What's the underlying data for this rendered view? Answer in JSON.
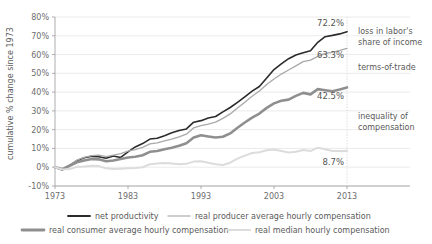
{
  "chart_data": {
    "type": "line",
    "title": "",
    "xlabel": "",
    "ylabel": "cumulative % change since 1973",
    "xlim": [
      1973,
      2014
    ],
    "ylim": [
      -10,
      80
    ],
    "grid": true,
    "legend_position": "bottom",
    "x_ticks": [
      "1973",
      "1983",
      "1993",
      "2003",
      "2013"
    ],
    "x_tick_values": [
      1973,
      1983,
      1993,
      2003,
      2013
    ],
    "y_ticks": [
      "-10%",
      "0%",
      "10%",
      "20%",
      "30%",
      "40%",
      "50%",
      "60%",
      "70%",
      "80%"
    ],
    "y_tick_values": [
      -10,
      0,
      10,
      20,
      30,
      40,
      50,
      60,
      70,
      80
    ],
    "x": [
      1973,
      1974,
      1975,
      1976,
      1977,
      1978,
      1979,
      1980,
      1981,
      1982,
      1983,
      1984,
      1985,
      1986,
      1987,
      1988,
      1989,
      1990,
      1991,
      1992,
      1993,
      1994,
      1995,
      1996,
      1997,
      1998,
      1999,
      2000,
      2001,
      2002,
      2003,
      2004,
      2005,
      2006,
      2007,
      2008,
      2009,
      2010,
      2011,
      2012,
      2013
    ],
    "series": [
      {
        "name": "net productivity",
        "color": "#2b2b2b",
        "width": 1.6,
        "end_label": "72.2%",
        "values": [
          0,
          -1.5,
          1.0,
          3.5,
          5.0,
          5.8,
          5.6,
          4.8,
          6.0,
          5.2,
          8.2,
          10.8,
          12.6,
          15.0,
          15.4,
          16.8,
          18.3,
          19.6,
          20.4,
          24.0,
          24.8,
          26.2,
          27.0,
          29.5,
          31.8,
          34.5,
          37.5,
          40.5,
          43.0,
          47.5,
          52.0,
          55.0,
          57.8,
          59.8,
          61.0,
          62.0,
          66.5,
          69.5,
          70.2,
          71.0,
          72.2
        ]
      },
      {
        "name": "real producer average hourly compensation",
        "color": "#a9a9a9",
        "width": 1.3,
        "end_label": "63.3%",
        "values": [
          0,
          -1.2,
          1.2,
          3.8,
          5.2,
          6.2,
          6.4,
          5.6,
          6.4,
          7.2,
          8.6,
          9.4,
          10.6,
          12.4,
          13.0,
          14.0,
          15.0,
          16.2,
          17.6,
          21.0,
          22.2,
          23.0,
          24.0,
          26.0,
          28.4,
          31.5,
          34.6,
          37.8,
          40.6,
          44.0,
          47.0,
          49.6,
          51.8,
          54.0,
          56.2,
          57.0,
          59.0,
          60.6,
          61.2,
          62.2,
          63.3
        ]
      },
      {
        "name": "real consumer average hourly compensation",
        "color": "#8f8f8f",
        "width": 2.6,
        "end_label": "42.5%",
        "values": [
          0,
          -1.0,
          0.8,
          2.6,
          3.6,
          4.4,
          4.2,
          3.2,
          3.6,
          4.4,
          5.2,
          5.6,
          6.4,
          8.2,
          8.6,
          9.6,
          10.4,
          11.4,
          12.8,
          15.8,
          17.0,
          16.4,
          15.8,
          16.2,
          18.0,
          21.0,
          23.8,
          26.4,
          28.6,
          31.6,
          34.0,
          35.4,
          36.0,
          38.0,
          39.6,
          38.8,
          41.6,
          41.0,
          40.4,
          41.4,
          42.5
        ]
      },
      {
        "name": "real median hourly compensation",
        "color": "#dcdcdc",
        "width": 2.0,
        "end_label": "8.7%",
        "values": [
          0,
          -1.2,
          -1.0,
          0.2,
          0.4,
          0.8,
          0.6,
          -0.6,
          -1.0,
          -0.8,
          -0.6,
          -0.4,
          0.0,
          1.6,
          2.0,
          2.2,
          2.0,
          1.6,
          1.8,
          3.0,
          3.2,
          2.4,
          1.6,
          1.2,
          2.4,
          4.6,
          6.2,
          7.6,
          8.0,
          9.0,
          9.4,
          8.6,
          7.8,
          8.2,
          9.2,
          8.6,
          10.4,
          9.6,
          8.6,
          8.6,
          8.7
        ]
      }
    ],
    "annotations": [
      {
        "text": "loss in labor's",
        "id": "loss-in-labor-share-line1"
      },
      {
        "text": "share of income",
        "id": "loss-in-labor-share-line2"
      },
      {
        "text": "terms-of-trade",
        "id": "terms-of-trade"
      },
      {
        "text": "inequality of",
        "id": "inequality-of-compensation-line1"
      },
      {
        "text": "compensation",
        "id": "inequality-of-compensation-line2"
      }
    ],
    "legend": [
      {
        "label": "net productivity",
        "color": "#2b2b2b",
        "width": 1.8
      },
      {
        "label": "real producer average hourly compensation",
        "color": "#bdbdbd",
        "width": 1.4
      },
      {
        "label": "real consumer average hourly compensation",
        "color": "#8f8f8f",
        "width": 2.8
      },
      {
        "label": "real median hourly compensation",
        "color": "#dcdcdc",
        "width": 2.2
      }
    ]
  }
}
